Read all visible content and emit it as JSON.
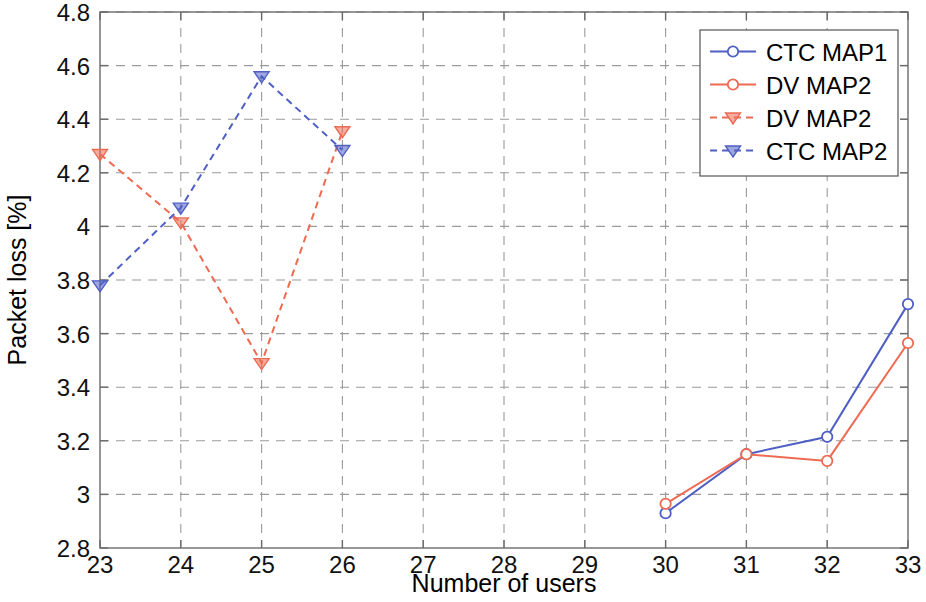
{
  "chart_data": {
    "type": "line",
    "title": "",
    "xlabel": "Number of users",
    "ylabel": "Packet loss [%]",
    "xlim": [
      23,
      33
    ],
    "ylim": [
      2.8,
      4.8
    ],
    "x_ticks": [
      "23",
      "24",
      "25",
      "26",
      "27",
      "28",
      "29",
      "30",
      "31",
      "32",
      "33"
    ],
    "x_tick_values": [
      23,
      24,
      25,
      26,
      27,
      28,
      29,
      30,
      31,
      32,
      33
    ],
    "y_ticks": [
      "2.8",
      "3",
      "3.2",
      "3.4",
      "3.6",
      "3.8",
      "4",
      "4.2",
      "4.4",
      "4.6",
      "4.8"
    ],
    "y_tick_values": [
      2.8,
      3.0,
      3.2,
      3.4,
      3.6,
      3.8,
      4.0,
      4.2,
      4.4,
      4.6,
      4.8
    ],
    "grid": true,
    "grid_style": "dashed",
    "legend_position": "top-right",
    "series": [
      {
        "name": "CTC MAP1",
        "color": "#4f5fc4",
        "linestyle": "solid",
        "marker": "circle-open",
        "x": [
          30,
          31,
          32,
          33
        ],
        "values": [
          2.93,
          3.15,
          3.215,
          3.71
        ]
      },
      {
        "name": "DV MAP2",
        "color": "#ee6a52",
        "linestyle": "solid",
        "marker": "circle-open",
        "x": [
          30,
          31,
          32,
          33
        ],
        "values": [
          2.965,
          3.15,
          3.125,
          3.565
        ]
      },
      {
        "name": "DV MAP2",
        "color": "#ee6a52",
        "linestyle": "dashed",
        "marker": "triangle-down",
        "x": [
          23,
          24,
          25,
          26
        ],
        "values": [
          4.27,
          4.015,
          3.49,
          4.355
        ]
      },
      {
        "name": "CTC MAP2",
        "color": "#4f5fc4",
        "linestyle": "dashed",
        "marker": "triangle-down",
        "x": [
          23,
          24,
          25,
          26
        ],
        "values": [
          3.78,
          4.07,
          4.56,
          4.285
        ]
      }
    ]
  },
  "legend": {
    "entries": [
      {
        "label": "CTC MAP1"
      },
      {
        "label": "DV MAP2"
      },
      {
        "label": "DV MAP2"
      },
      {
        "label": "CTC MAP2"
      }
    ]
  },
  "colors": {
    "series_blue": "#4f5fc4",
    "series_red": "#ee6a52",
    "axis": "#6b6b6b",
    "grid": "#9a9a9a",
    "text": "#000000",
    "background": "#ffffff"
  }
}
